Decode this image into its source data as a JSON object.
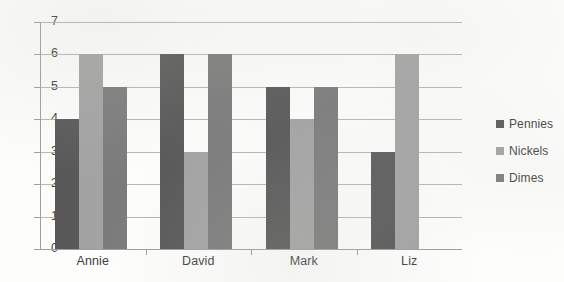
{
  "chart_data": {
    "type": "bar",
    "title": "",
    "subtitle": "",
    "xlabel": "",
    "ylabel": "",
    "categories": [
      "Annie",
      "David",
      "Mark",
      "Liz"
    ],
    "series": [
      {
        "name": "Pennies",
        "color": "#585858",
        "values": [
          4,
          6,
          5,
          3
        ]
      },
      {
        "name": "Nickels",
        "color": "#a3a3a3",
        "values": [
          6,
          3,
          4,
          6
        ]
      },
      {
        "name": "Dimes",
        "color": "#7b7b7b",
        "values": [
          5,
          6,
          5,
          0
        ]
      }
    ],
    "ylim": [
      0,
      7
    ],
    "ytick_step": 1,
    "yticks": [
      "7",
      "6",
      "5",
      "4",
      "3",
      "2",
      "1",
      "0"
    ],
    "grid": true,
    "grid_axis": "y",
    "legend": true,
    "legend_position": "right"
  },
  "axis": {
    "y_tick_labels": [
      "7",
      "6",
      "5",
      "4",
      "3",
      "2",
      "1",
      "0"
    ],
    "x_tick_labels": [
      "Annie",
      "David",
      "Mark",
      "Liz"
    ]
  },
  "legend": {
    "items": [
      {
        "label": "Pennies",
        "swatch": "pennies"
      },
      {
        "label": "Nickels",
        "swatch": "nickels"
      },
      {
        "label": "Dimes",
        "swatch": "dimes"
      }
    ]
  },
  "colors": {
    "pennies": "#585858",
    "nickels": "#a3a3a3",
    "dimes": "#7b7b7b",
    "gridline": "#b6b6b6",
    "axis": "#9e9e9e",
    "text": "#3f3f3f",
    "background": "#fdfdfc"
  }
}
